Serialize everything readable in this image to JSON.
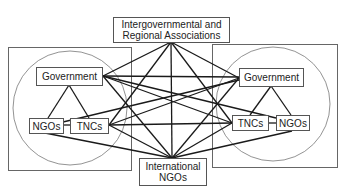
{
  "diagram": {
    "type": "network",
    "nodes": {
      "igo": {
        "line1": "Intergovernmental and",
        "line2": "Regional Associations"
      },
      "ingo": {
        "line1": "International",
        "line2": "NGOs"
      },
      "left": {
        "government": "Government",
        "ngos": "NGOs",
        "tncs": "TNCs"
      },
      "right": {
        "government": "Government",
        "tncs": "TNCs",
        "ngos": "NGOs"
      }
    },
    "edges": [
      [
        "left.government",
        "left.ngos"
      ],
      [
        "left.government",
        "left.tncs"
      ],
      [
        "left.ngos",
        "left.tncs"
      ],
      [
        "right.government",
        "right.tncs"
      ],
      [
        "right.government",
        "right.ngos"
      ],
      [
        "right.tncs",
        "right.ngos"
      ],
      [
        "igo",
        "left.government"
      ],
      [
        "igo",
        "right.government"
      ],
      [
        "igo",
        "ingo"
      ],
      [
        "igo",
        "left.tncs"
      ],
      [
        "igo",
        "right.tncs"
      ],
      [
        "left.government",
        "right.government"
      ],
      [
        "left.government",
        "right.tncs"
      ],
      [
        "left.government",
        "right.ngos"
      ],
      [
        "left.government",
        "ingo"
      ],
      [
        "left.tncs",
        "right.government"
      ],
      [
        "left.tncs",
        "right.tncs"
      ],
      [
        "left.tncs",
        "ingo"
      ],
      [
        "left.ngos",
        "right.government"
      ],
      [
        "left.ngos",
        "ingo"
      ],
      [
        "right.government",
        "ingo"
      ],
      [
        "right.tncs",
        "ingo"
      ],
      [
        "right.ngos",
        "ingo"
      ]
    ],
    "colors": {
      "line": "#1a1a1a",
      "frame": "#666666",
      "text": "#222222"
    }
  }
}
